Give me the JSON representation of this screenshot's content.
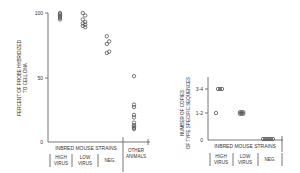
{
  "chart_data": [
    {
      "type": "scatter",
      "title": "",
      "ylabel": "PERCENT OF PROBE HYBRIDIZED TO CELL DNA",
      "ylabel_lines": [
        "PERCENT OF PROBE HYBRIDIZED",
        "TO CELL DNA"
      ],
      "xlabel": "",
      "ylim": [
        0,
        100
      ],
      "yticks": [
        "0",
        "50",
        "100"
      ],
      "group_header": "INBRED MOUSE STRAINS",
      "categories": [
        "HIGH VIRUS",
        "LOW VIRUS",
        "NEG.",
        "OTHER ANIMALS"
      ],
      "category_lines": [
        [
          "HIGH",
          "VIRUS"
        ],
        [
          "LOW",
          "VIRUS"
        ],
        [
          "NEG."
        ],
        [
          "OTHER",
          "ANIMALS"
        ]
      ],
      "series": [
        {
          "name": "HIGH VIRUS",
          "values": [
            100,
            99,
            98,
            97,
            96,
            95
          ]
        },
        {
          "name": "LOW VIRUS",
          "values": [
            100,
            98,
            95,
            93,
            92,
            91,
            90,
            89
          ]
        },
        {
          "name": "NEG.",
          "values": [
            82,
            78,
            76,
            70,
            69
          ]
        },
        {
          "name": "OTHER ANIMALS",
          "values": [
            51,
            29,
            27,
            21,
            19,
            15,
            13,
            12,
            11,
            10
          ]
        }
      ],
      "grid": false,
      "legend": null
    },
    {
      "type": "scatter",
      "title": "",
      "ylabel": "NUMBER OF COPIES OF TYPE SPECIFIC SEQUENCES",
      "ylabel_lines": [
        "NUMBER OF COPIES",
        "OF TYPE SPECIFIC SEQUENCES"
      ],
      "xlabel": "",
      "yticks": [
        "0",
        "1-2",
        "3-4"
      ],
      "group_header": "INBRED MOUSE STRAINS",
      "categories": [
        "HIGH VIRUS",
        "LOW VIRUS",
        "NEG."
      ],
      "category_lines": [
        [
          "HIGH",
          "VIRUS"
        ],
        [
          "LOW",
          "VIRUS"
        ],
        [
          "NEG."
        ]
      ],
      "series": [
        {
          "name": "HIGH VIRUS",
          "values": [
            "3-4",
            "3-4",
            "3-4",
            "1-2"
          ]
        },
        {
          "name": "LOW VIRUS",
          "values": [
            "1-2",
            "1-2",
            "1-2",
            "1-2",
            "1-2",
            "1-2"
          ]
        },
        {
          "name": "NEG.",
          "values": [
            "0",
            "0",
            "0",
            "0",
            "0",
            "0"
          ]
        }
      ],
      "grid": false,
      "legend": null
    }
  ]
}
